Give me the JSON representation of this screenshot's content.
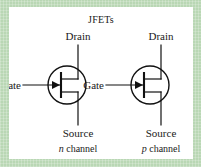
{
  "figure": {
    "title": "JFETs",
    "title_color": "#9b4f52",
    "frame_color": "#b9d7b4",
    "panel_color": "#ffffff",
    "ink_color": "#111111",
    "channel_label_color": "#3a8fc4"
  },
  "symbols": [
    {
      "id": "n-channel-jfet",
      "drain_label": "Drain",
      "gate_label": "Gate",
      "source_label": "Source",
      "channel_type_letter": "n",
      "channel_suffix": " channel",
      "arrow_direction": "in"
    },
    {
      "id": "p-channel-jfet",
      "drain_label": "Drain",
      "gate_label": "Gate",
      "source_label": "Source",
      "channel_type_letter": "p",
      "channel_suffix": " channel",
      "arrow_direction": "out"
    }
  ]
}
